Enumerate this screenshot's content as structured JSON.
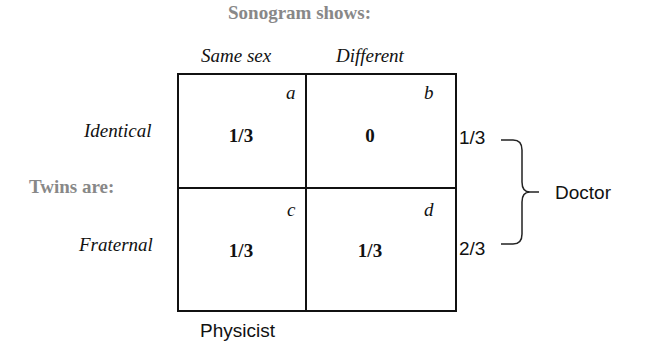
{
  "title": "Sonogram shows:",
  "row_group_label": "Twins are:",
  "columns": [
    "Same sex",
    "Different"
  ],
  "rows": [
    "Identical",
    "Fraternal"
  ],
  "cells": [
    {
      "corner": "a",
      "value": "1/3"
    },
    {
      "corner": "b",
      "value": "0"
    },
    {
      "corner": "c",
      "value": "1/3"
    },
    {
      "corner": "d",
      "value": "1/3"
    }
  ],
  "row_marginals": [
    "1/3",
    "2/3"
  ],
  "row_marginal_label": "Doctor",
  "column_label": "Physicist"
}
